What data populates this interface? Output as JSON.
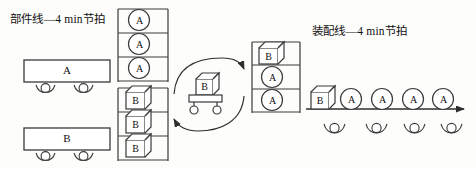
{
  "diagram": {
    "title_left": "部件线—4 min节拍",
    "title_right": "装配线—4 min节拍",
    "stroke_color": "#3a3a3a",
    "fill_color": "#ffffff",
    "background": "#fdfdfb"
  },
  "component_line": {
    "station_a_label": "A",
    "station_b_label": "B",
    "rollers_a": [
      "roller",
      "roller"
    ],
    "rollers_b": [
      "roller",
      "roller"
    ]
  },
  "rack_a": {
    "shelves": 3,
    "items": [
      "A",
      "A",
      "A"
    ],
    "item_shape": "circle"
  },
  "rack_b": {
    "shelves": 3,
    "items": [
      "B",
      "B",
      "B"
    ],
    "item_shape": "cube"
  },
  "cart": {
    "load_label": "B",
    "wheels": 2,
    "loop_arrow_top": "arrow-right",
    "loop_arrow_bottom": "arrow-left"
  },
  "assembly_rack": {
    "shelves": 3,
    "items": [
      "B",
      "A",
      "A"
    ],
    "item_shapes": [
      "cube",
      "circle",
      "circle"
    ]
  },
  "assembly_line": {
    "first_item": "B",
    "first_item_shape": "cube",
    "circles": [
      "A",
      "A",
      "A",
      "A"
    ],
    "rollers": [
      "roller",
      "roller",
      "roller",
      "roller"
    ],
    "direction": "arrow-right"
  }
}
